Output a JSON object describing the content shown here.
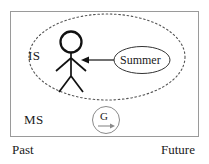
{
  "diagram": {
    "type": "conceptual-timeline-diagram",
    "frame": {
      "name": "outer-rectangle",
      "border_color": "#9a9a9a",
      "x": 10,
      "y": 11,
      "width": 189,
      "height": 126
    },
    "boundary_ellipse": {
      "name": "dashed-boundary-ellipse",
      "style": "dotted",
      "color": "#555555",
      "cx": 107,
      "cy": 57,
      "rx": 78,
      "ry": 43
    },
    "regions": [
      {
        "id": "is",
        "label": "IS"
      },
      {
        "id": "ms",
        "label": "MS"
      }
    ],
    "actor": {
      "name": "stick-figure",
      "color": "#111111",
      "head_cx": 71,
      "head_cy": 42,
      "head_r": 11
    },
    "summer_node": {
      "label": "Summer",
      "shape": "ellipse",
      "cx": 142,
      "cy": 60,
      "rx": 28,
      "ry": 14,
      "color": "#333333"
    },
    "arrow": {
      "name": "summer-to-actor-arrow",
      "direction": "left",
      "from_x": 114,
      "to_x": 82,
      "y": 60,
      "color": "#111111"
    },
    "g_node": {
      "label": "G",
      "shape": "circle",
      "cx": 106,
      "cy": 120,
      "r": 14,
      "color": "#8a8a8a",
      "inner_arrow": "rightward-arrow"
    },
    "axis_labels": {
      "left": "Past",
      "right": "Future"
    }
  }
}
